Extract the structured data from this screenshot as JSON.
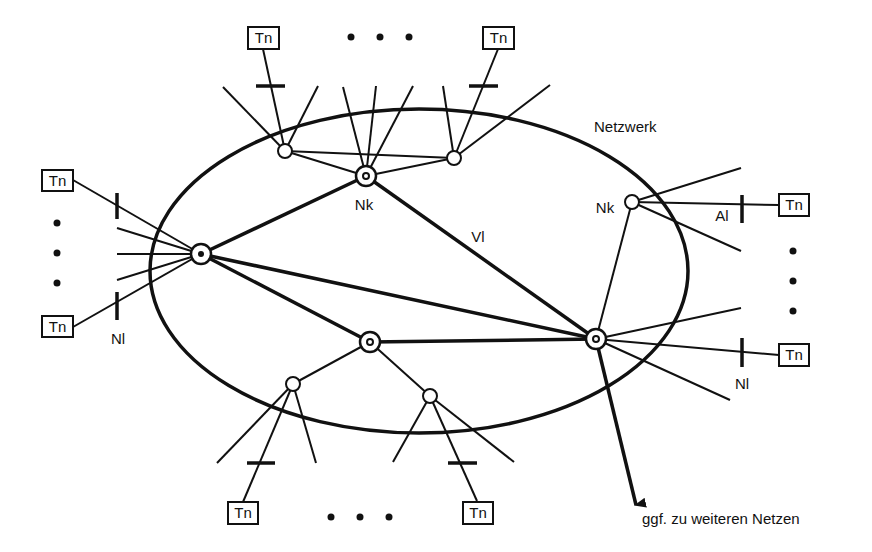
{
  "diagram": {
    "network_label": "Netzwerk",
    "node_labels": {
      "top_hub": "Nk",
      "right_node": "Nk"
    },
    "link_labels": {
      "vl": "Vl",
      "al": "Al",
      "nl_left": "Nl",
      "nl_right": "Nl"
    },
    "arrow_label": "ggf. zu weiteren Netzen",
    "terminal_label": "Tn",
    "terminals": [
      {
        "id": "tn-top-left",
        "label": "Tn"
      },
      {
        "id": "tn-top-right",
        "label": "Tn"
      },
      {
        "id": "tn-left-top",
        "label": "Tn"
      },
      {
        "id": "tn-left-bottom",
        "label": "Tn"
      },
      {
        "id": "tn-right-top",
        "label": "Tn"
      },
      {
        "id": "tn-right-bottom",
        "label": "Tn"
      },
      {
        "id": "tn-bottom-left",
        "label": "Tn"
      },
      {
        "id": "tn-bottom-right",
        "label": "Tn"
      }
    ],
    "colors": {
      "stroke": "#111111",
      "background": "#ffffff"
    }
  }
}
